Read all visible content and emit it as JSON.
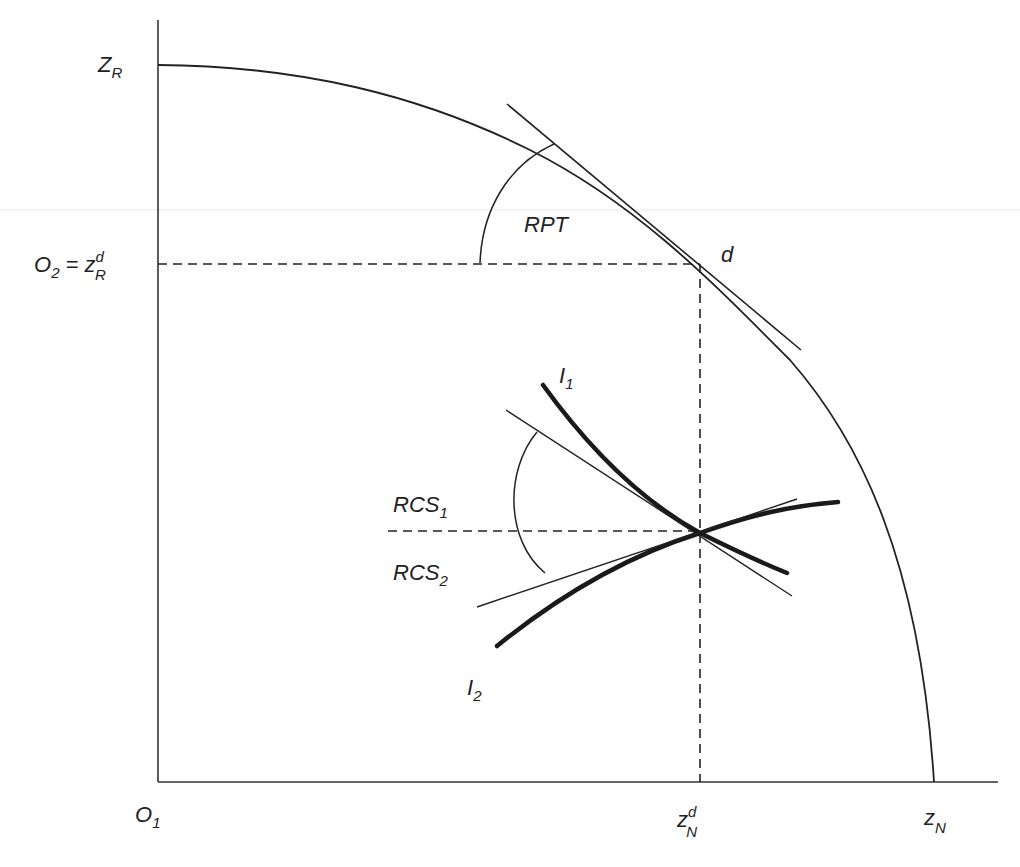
{
  "diagram": {
    "type": "production-possibility-frontier",
    "colors": {
      "ink": "#222222",
      "background": "#ffffff",
      "scan_line": "#e6e6e6"
    },
    "axes": {
      "origin_label": {
        "main": "O",
        "sub": "1"
      },
      "y_top_label": {
        "main": "Z",
        "sub": "R"
      },
      "y_mid_label": {
        "main": "O",
        "sub": "2",
        "eq": " = z",
        "sup": "d",
        "sub2": "R"
      },
      "x_mid_label": {
        "main": "z",
        "sup": "d",
        "sub": "N"
      },
      "x_end_label": {
        "main": "z",
        "sub": "N"
      }
    },
    "point_label": "d",
    "angle_labels": {
      "rpt": "RPT",
      "rcs1": {
        "main": "RCS",
        "sub": "1"
      },
      "rcs2": {
        "main": "RCS",
        "sub": "2"
      }
    },
    "curve_labels": {
      "i1": {
        "main": "I",
        "sub": "1"
      },
      "i2": {
        "main": "I",
        "sub": "2"
      }
    }
  }
}
